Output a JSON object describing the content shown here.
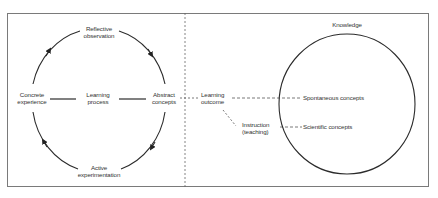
{
  "diagram": {
    "left_panel": {
      "cycle": {
        "top": {
          "line1": "Reflective",
          "line2": "observation"
        },
        "left": {
          "line1": "Concrete",
          "line2": "experience"
        },
        "center": {
          "line1": "Learning",
          "line2": "process"
        },
        "right": {
          "line1": "Abstract",
          "line2": "concepts"
        },
        "bottom": {
          "line1": "Active",
          "line2": "experimentation"
        },
        "direction": "clockwise"
      }
    },
    "bridge": {
      "outcome": {
        "line1": "Learning",
        "line2": "outcome"
      },
      "instruction": {
        "line1": "Instruction",
        "line2": "(teaching)"
      }
    },
    "right_panel": {
      "title": "Knowledge",
      "items": [
        "Spontaneous concepts",
        "Scientific concepts"
      ]
    },
    "colors": {
      "line": "#2b2b2b",
      "border": "#7a7a7a",
      "dashed": "#555555"
    }
  }
}
